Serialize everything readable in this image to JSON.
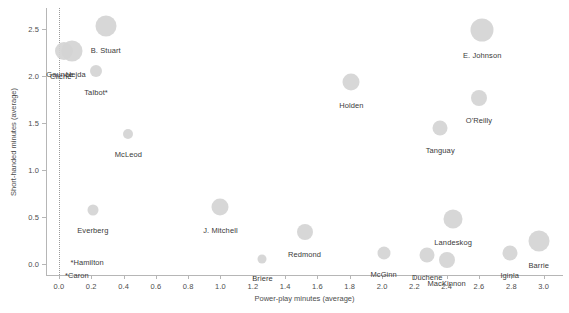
{
  "chart_data": {
    "type": "scatter",
    "title": "",
    "xlabel": "Power-play minutes (average)",
    "ylabel": "Short-handed minutes (average)",
    "xlim": [
      -0.08,
      3.12
    ],
    "ylim": [
      -0.12,
      2.72
    ],
    "xticks": [
      0.0,
      0.2,
      0.4,
      0.6,
      0.8,
      1.0,
      1.2,
      1.4,
      1.6,
      1.8,
      2.0,
      2.2,
      2.4,
      2.6,
      2.8,
      3.0
    ],
    "xticklabels": [
      "0.0",
      "0.2",
      "0.4",
      "0.6",
      "0.8",
      "1.0",
      "1.2",
      "1.4",
      "1.6",
      "1.8",
      "2.0",
      "2.2",
      "2.4",
      "2.6",
      "2.8",
      "3.0"
    ],
    "yticks": [
      0.0,
      0.5,
      1.0,
      1.5,
      2.0,
      2.5
    ],
    "yticklabels": [
      "0.0",
      "0.5",
      "1.0",
      "1.5",
      "2.0",
      "2.5"
    ],
    "grid": false,
    "legend": null,
    "marker_color": "#d4d4d4",
    "reference_lines": [
      {
        "axis": "x",
        "value": 0.0,
        "style": "dotted"
      }
    ],
    "size_encoding": "bubble area (time on ice)",
    "points": [
      {
        "label": "B. Stuart",
        "x": 0.29,
        "y": 2.53,
        "size": 21,
        "label_dx": 0,
        "label_dy": 20
      },
      {
        "label": "E. Johnson",
        "x": 2.62,
        "y": 2.49,
        "size": 23,
        "label_dx": 0,
        "label_dy": 21
      },
      {
        "label": "Gaunce",
        "x": 0.03,
        "y": 2.26,
        "size": 18,
        "label_dx": -4,
        "label_dy": 19
      },
      {
        "label": "Hejda",
        "x": 0.08,
        "y": 2.26,
        "size": 21,
        "label_dx": 4,
        "label_dy": 19
      },
      {
        "label": "Cliche",
        "x": 0.03,
        "y": 2.13,
        "size": 0,
        "label_dx": -3,
        "label_dy": 9
      },
      {
        "label": "Talbot*",
        "x": 0.23,
        "y": 2.05,
        "size": 12,
        "label_dx": 0,
        "label_dy": 17
      },
      {
        "label": "Holden",
        "x": 1.81,
        "y": 1.93,
        "size": 17,
        "label_dx": 0,
        "label_dy": 19
      },
      {
        "label": "O'Reilly",
        "x": 2.6,
        "y": 1.76,
        "size": 16,
        "label_dx": 0,
        "label_dy": 18
      },
      {
        "label": "Tanguay",
        "x": 2.36,
        "y": 1.44,
        "size": 15,
        "label_dx": 0,
        "label_dy": 18
      },
      {
        "label": "McLeod",
        "x": 0.43,
        "y": 1.38,
        "size": 10,
        "label_dx": 0,
        "label_dy": 16
      },
      {
        "label": "J. Mitchell",
        "x": 1.0,
        "y": 0.6,
        "size": 17,
        "label_dx": 0,
        "label_dy": 19
      },
      {
        "label": "Everberg",
        "x": 0.21,
        "y": 0.57,
        "size": 11,
        "label_dx": 0,
        "label_dy": 16
      },
      {
        "label": "Landeskog",
        "x": 2.44,
        "y": 0.48,
        "size": 19,
        "label_dx": 0,
        "label_dy": 19
      },
      {
        "label": "Redmond",
        "x": 1.52,
        "y": 0.34,
        "size": 16,
        "label_dx": 0,
        "label_dy": 18
      },
      {
        "label": "Barrie",
        "x": 2.97,
        "y": 0.24,
        "size": 21,
        "label_dx": 0,
        "label_dy": 20
      },
      {
        "label": "McGinn",
        "x": 2.01,
        "y": 0.11,
        "size": 13,
        "label_dx": 0,
        "label_dy": 17
      },
      {
        "label": "Iginla",
        "x": 2.79,
        "y": 0.11,
        "size": 15,
        "label_dx": 0,
        "label_dy": 18
      },
      {
        "label": "Duchene",
        "x": 2.28,
        "y": 0.09,
        "size": 15,
        "label_dx": 0,
        "label_dy": 18
      },
      {
        "label": "MacKinnon",
        "x": 2.4,
        "y": 0.04,
        "size": 16,
        "label_dx": 0,
        "label_dy": 19
      },
      {
        "label": "Briere",
        "x": 1.26,
        "y": 0.05,
        "size": 9,
        "label_dx": 0,
        "label_dy": 15
      },
      {
        "label": "*Hamilton",
        "x": 0.02,
        "y": 0.08,
        "size": 0,
        "label_dx": 25,
        "label_dy": 2
      },
      {
        "label": "*Caron",
        "x": 0.0,
        "y": 0.0,
        "size": 0,
        "label_dx": 18,
        "label_dy": 7
      }
    ]
  }
}
